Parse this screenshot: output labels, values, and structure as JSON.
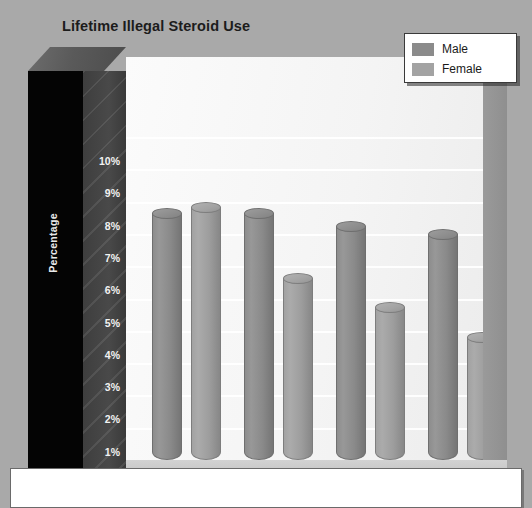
{
  "chart_data": {
    "type": "bar",
    "title": "Lifetime Illegal Steroid Use",
    "xlabel": "",
    "ylabel": "Percentage",
    "categories": [
      "Grade 9",
      "Grade 10",
      "Grade 11",
      "Grade 12"
    ],
    "series": [
      {
        "name": "Male",
        "values": [
          7.8,
          7.8,
          7.4,
          7.15
        ]
      },
      {
        "name": "Female",
        "values": [
          8.0,
          5.8,
          4.9,
          3.95
        ]
      }
    ],
    "ylim": [
      0,
      10
    ],
    "ytick_labels": [
      "10%",
      "9%",
      "8%",
      "7%",
      "6%",
      "5%",
      "4%",
      "3%",
      "2%",
      "1%",
      "0"
    ],
    "ytick_values": [
      10,
      9,
      8,
      7,
      6,
      5,
      4,
      3,
      2,
      1,
      0
    ],
    "grid": true,
    "legend_position": "top-right",
    "colors": {
      "male": "#8b8b8b",
      "female": "#a3a3a3",
      "page_background": "#a9a9a9",
      "plot_background": "#f6f6f6",
      "axis_panel": "#040404",
      "tick_panel": "#444444",
      "floor_band": "#4e4e4e",
      "title_text": "#1c1c1c",
      "tick_text": "#f2f2f2"
    }
  },
  "legend": {
    "items": [
      {
        "label": "Male",
        "swatch": "male"
      },
      {
        "label": "Female",
        "swatch": "female"
      }
    ]
  }
}
